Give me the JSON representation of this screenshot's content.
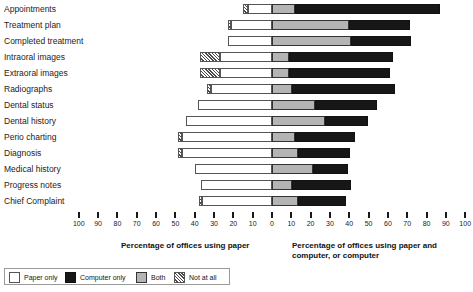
{
  "chart_data": {
    "type": "bar",
    "subtype": "diverging-stacked-horizontal",
    "title": "",
    "categories": [
      "Appointments",
      "Treatment plan",
      "Completed treatment",
      "Intraoral images",
      "Extraoral images",
      "Radiographs",
      "Dental status",
      "Dental history",
      "Perio charting",
      "Diagnosis",
      "Medical history",
      "Progress notes",
      "Chief Complaint"
    ],
    "series": [
      {
        "name": "Not at all",
        "side": "left",
        "color": "#ffffff",
        "hatched": true,
        "values": [
          2.5,
          2,
          0,
          10.5,
          10.5,
          2,
          0,
          0,
          2,
          2,
          0,
          0,
          2
        ]
      },
      {
        "name": "Paper only",
        "side": "left",
        "color": "#ffffff",
        "values": [
          12.5,
          21,
          23,
          27,
          27,
          31.5,
          38.5,
          44.5,
          46.5,
          46.5,
          40,
          36.5,
          36
        ]
      },
      {
        "name": "Both",
        "side": "right",
        "color": "#b4b4b4",
        "values": [
          12,
          40,
          41,
          9,
          9,
          10.5,
          22,
          27.5,
          12,
          13.5,
          21,
          10.5,
          13.5
        ]
      },
      {
        "name": "Computer only",
        "side": "right",
        "color": "#171717",
        "values": [
          75,
          31.5,
          31,
          53.5,
          52,
          53,
          32.5,
          22,
          31,
          27,
          18.5,
          30.5,
          25
        ]
      }
    ],
    "xaxis": {
      "left_label": "Percentage of offices using paper",
      "right_label": "Percentage of offices using paper and computer, or computer",
      "left_ticks": [
        100,
        90,
        80,
        70,
        60,
        50,
        40,
        30,
        20,
        10
      ],
      "center_tick": 0,
      "right_ticks": [
        10,
        20,
        30,
        40,
        50,
        60,
        70,
        80,
        90,
        100
      ],
      "range": [
        -100,
        100
      ],
      "grid": false
    },
    "legend": {
      "position": "bottom-left",
      "entries": [
        {
          "label": "Paper only",
          "swatch": "white"
        },
        {
          "label": "Computer only",
          "swatch": "black"
        },
        {
          "label": "Both",
          "swatch": "gray"
        },
        {
          "label": "Not at all",
          "swatch": "hatched"
        }
      ]
    }
  }
}
